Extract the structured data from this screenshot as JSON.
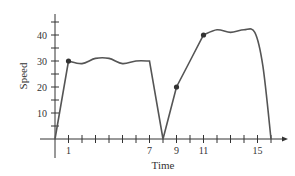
{
  "chart_data": {
    "type": "line",
    "title": "",
    "xlabel": "Time",
    "ylabel": "Speed",
    "x_tick_labels": [
      "1",
      "7",
      "9",
      "11",
      "15"
    ],
    "x_tick_label_values": [
      1,
      7,
      9,
      11,
      15
    ],
    "x_minor_ticks": [
      1,
      2,
      3,
      4,
      5,
      6,
      7,
      8,
      9,
      10,
      11,
      12,
      13,
      14,
      15,
      16
    ],
    "y_tick_labels": [
      "10",
      "20",
      "30",
      "40"
    ],
    "y_tick_label_values": [
      10,
      20,
      30,
      40
    ],
    "y_minor_ticks": [
      5,
      10,
      15,
      20,
      25,
      30,
      35,
      40,
      45
    ],
    "xlim": [
      0,
      17
    ],
    "ylim": [
      0,
      48
    ],
    "grid": false,
    "legend": null,
    "series": [
      {
        "name": "speed",
        "x": [
          0,
          1,
          2,
          3,
          4,
          5,
          6,
          7,
          8,
          9,
          10,
          11,
          12,
          13,
          14,
          14.8,
          15.4,
          16
        ],
        "values": [
          0,
          30,
          29,
          31,
          31,
          29,
          30,
          30,
          0,
          20,
          30,
          40,
          42,
          41,
          42,
          41,
          28,
          0
        ]
      }
    ],
    "marked_points": [
      {
        "x": 1,
        "y": 30
      },
      {
        "x": 9,
        "y": 20
      },
      {
        "x": 11,
        "y": 40
      }
    ],
    "line_color": "#555555",
    "axis_color": "#333333"
  }
}
